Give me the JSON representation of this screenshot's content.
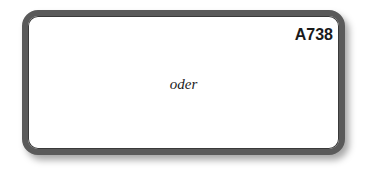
{
  "card": {
    "code": "A738",
    "word": "oder"
  }
}
